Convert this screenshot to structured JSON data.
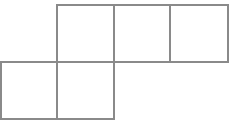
{
  "figure": {
    "shape_type": "polyomino-net",
    "square_count": 5,
    "background_color": "#ffffff",
    "stroke_color": "#8a8a8a",
    "fill_color": "#ffffff",
    "stroke_width": 1.6,
    "canvas": {
      "width": 244,
      "height": 129
    },
    "grid": {
      "cell_size": 57,
      "x_lines": [
        1,
        57,
        114,
        170,
        228
      ],
      "y_lines": [
        5,
        62,
        119
      ],
      "columns": 4,
      "rows": 2
    },
    "squares": [
      {
        "name": "top-row-square-1",
        "row": 0,
        "col": 1,
        "x": 57,
        "y": 5,
        "width": 57,
        "height": 57
      },
      {
        "name": "top-row-square-2",
        "row": 0,
        "col": 2,
        "x": 114,
        "y": 5,
        "width": 56,
        "height": 57
      },
      {
        "name": "top-row-square-3",
        "row": 0,
        "col": 3,
        "x": 170,
        "y": 5,
        "width": 58,
        "height": 57
      },
      {
        "name": "bottom-row-square-1",
        "row": 1,
        "col": 0,
        "x": 1,
        "y": 62,
        "width": 56,
        "height": 57
      },
      {
        "name": "bottom-row-square-2",
        "row": 1,
        "col": 1,
        "x": 57,
        "y": 62,
        "width": 57,
        "height": 57
      }
    ]
  }
}
